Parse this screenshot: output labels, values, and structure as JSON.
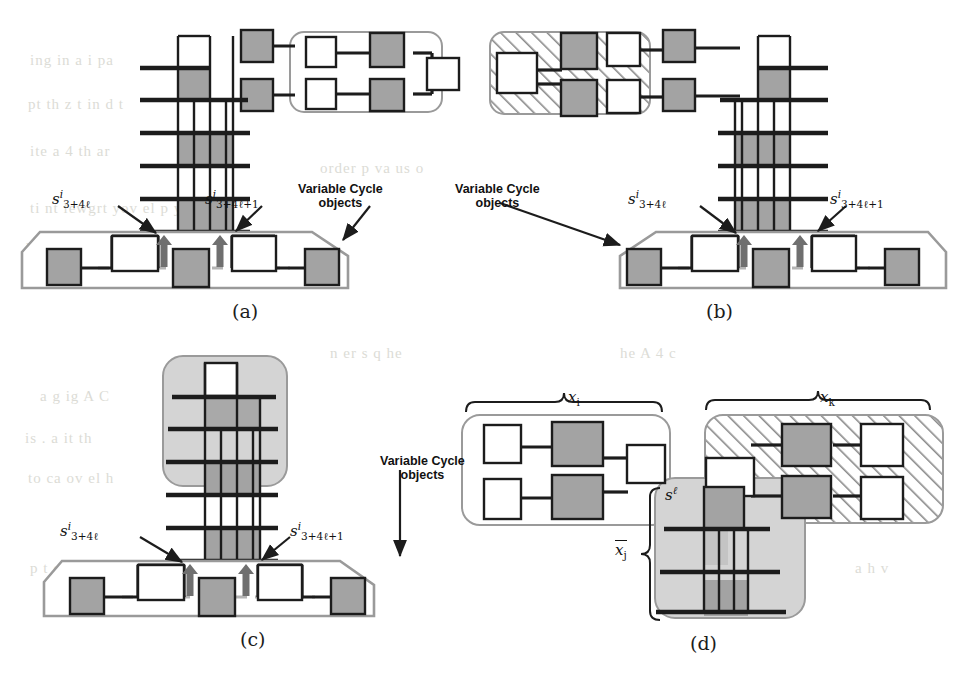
{
  "figure": {
    "domain": "diagram",
    "kind": "graph-gadget-figure",
    "width": 953,
    "height": 675,
    "colors": {
      "gray_fill": "#a3a3a3",
      "light_gray_fill": "#d4d4d4",
      "outline_gray": "#8f8f8f",
      "ink": "#1c1c1c",
      "paper": "#ffffff",
      "bleed": "#dcdcd6"
    },
    "panels": [
      {
        "id": "a",
        "label": "(a)",
        "label_x": 232,
        "label_y": 300,
        "annotations": [
          {
            "name": "s-left",
            "tex": "s^i_{3+4l}",
            "base": "s",
            "sup": "i",
            "sub": "3+4ℓ",
            "x": 52,
            "y": 188
          },
          {
            "name": "s-right",
            "tex": "s^i_{3+4l+1}",
            "base": "s",
            "sup": "i",
            "sub": "3+4ℓ+1",
            "x": 205,
            "y": 188
          },
          {
            "name": "variable-cycle-objects",
            "text": "Variable Cycle\nobjects",
            "line1": "Variable Cycle",
            "line2": "objects",
            "x": 298,
            "y": 183
          }
        ]
      },
      {
        "id": "b",
        "label": "(b)",
        "label_x": 706,
        "label_y": 300,
        "annotations": [
          {
            "name": "variable-cycle-objects",
            "line1": "Variable Cycle",
            "line2": "objects",
            "x": 455,
            "y": 183
          },
          {
            "name": "s-left",
            "base": "s",
            "sup": "i",
            "sub": "3+4ℓ",
            "x": 628,
            "y": 188
          },
          {
            "name": "s-right",
            "base": "s",
            "sup": "i",
            "sub": "3+4ℓ+1",
            "x": 830,
            "y": 188
          }
        ]
      },
      {
        "id": "c",
        "label": "(c)",
        "label_x": 240,
        "label_y": 628,
        "annotations": [
          {
            "name": "s-left",
            "base": "s",
            "sup": "i",
            "sub": "3+4ℓ",
            "x": 60,
            "y": 520
          },
          {
            "name": "s-right",
            "base": "s",
            "sup": "i",
            "sub": "3+4ℓ+1",
            "x": 290,
            "y": 520
          },
          {
            "name": "variable-cycle-objects",
            "line1": "Variable Cycle",
            "line2": "objects",
            "x": 380,
            "y": 455
          }
        ]
      },
      {
        "id": "d",
        "label": "(d)",
        "label_x": 690,
        "label_y": 632,
        "annotations": [
          {
            "name": "x-i",
            "base": "x",
            "sub": "i",
            "x": 568,
            "y": 388
          },
          {
            "name": "x-k",
            "base": "x",
            "sub": "k",
            "x": 820,
            "y": 388
          },
          {
            "name": "s-ell",
            "base": "s",
            "sup": "ℓ",
            "x": 665,
            "y": 484
          },
          {
            "name": "x-j-bar",
            "base": "x",
            "sub": "j",
            "overline": true,
            "x": 615,
            "y": 540
          }
        ]
      }
    ],
    "bleed_text": [
      {
        "t": "ing    in  a  i pa",
        "x": 30,
        "y": 52
      },
      {
        "t": "pt  th  z  t  in d t",
        "x": 28,
        "y": 96
      },
      {
        "t": "ite   a    4     th ar",
        "x": 30,
        "y": 143
      },
      {
        "t": "order  p   va  us o",
        "x": 320,
        "y": 160
      },
      {
        "t": "ti nt lewgrt yov el  p y      lfi  en",
        "x": 30,
        "y": 200
      },
      {
        "t": "hat   sor  I he    G    i",
        "x": 26,
        "y": 240
      },
      {
        "t": "n  er  s q  he",
        "x": 330,
        "y": 345
      },
      {
        "t": "he  A   4 c",
        "x": 620,
        "y": 345
      },
      {
        "t": "a g   ig   A  C",
        "x": 40,
        "y": 388
      },
      {
        "t": "is    .  a  it    th",
        "x": 25,
        "y": 430
      },
      {
        "t": "to    ca   ov    el   h",
        "x": 28,
        "y": 470
      },
      {
        "t": "p  t  of",
        "x": 30,
        "y": 560
      },
      {
        "t": "a  h  v",
        "x": 855,
        "y": 560
      }
    ]
  }
}
